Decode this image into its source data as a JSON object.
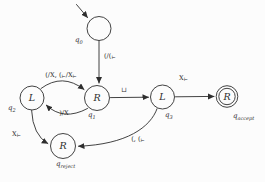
{
  "colors": {
    "ink": "#2e2e2e",
    "background": "#fcfcfc"
  },
  "states": [
    {
      "id": "q0",
      "name_base": "q",
      "name_sub": "0",
      "inner": "",
      "accepting": false,
      "start": true
    },
    {
      "id": "q1",
      "name_base": "q",
      "name_sub": "1",
      "inner": "R",
      "accepting": false,
      "start": false
    },
    {
      "id": "q2",
      "name_base": "q",
      "name_sub": "2",
      "inner": "L",
      "accepting": false,
      "start": false
    },
    {
      "id": "q3",
      "name_base": "q",
      "name_sub": "3",
      "inner": "L",
      "accepting": false,
      "start": false
    },
    {
      "id": "qaccept",
      "name_base": "q",
      "name_sub": "accept",
      "inner": "R",
      "accepting": true,
      "start": false
    },
    {
      "id": "qreject",
      "name_base": "q",
      "name_sub": "reject",
      "inner": "R",
      "accepting": false,
      "start": false
    }
  ],
  "transitions": [
    {
      "from": "q0",
      "to": "q1",
      "label": "(/(⊢"
    },
    {
      "from": "q2",
      "to": "q1",
      "label": "(/X, (⊢/X⊢"
    },
    {
      "from": "q1",
      "to": "q2",
      "label": ")/X"
    },
    {
      "from": "q1",
      "to": "q3",
      "label": "⊔"
    },
    {
      "from": "q3",
      "to": "qaccept",
      "label": "X⊢"
    },
    {
      "from": "q3",
      "to": "qreject",
      "label": "(, (⊢"
    },
    {
      "from": "q2",
      "to": "qreject",
      "label": "X⊢"
    }
  ]
}
